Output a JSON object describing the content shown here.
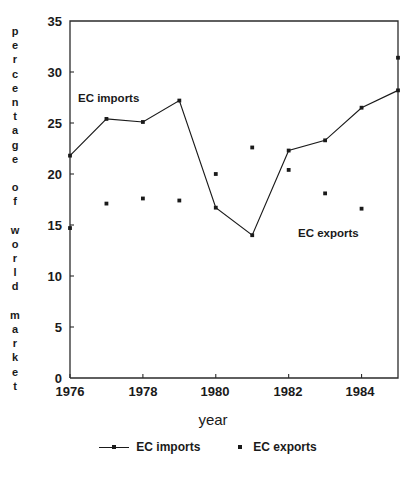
{
  "chart_data": {
    "type": "line",
    "title": "",
    "xlabel": "year",
    "ylabel": "percentage of world market",
    "ylabel_letters": [
      "p",
      "e",
      "r",
      "c",
      "e",
      "n",
      "t",
      "a",
      "g",
      "e",
      "",
      "o",
      "f",
      "",
      "w",
      "o",
      "r",
      "l",
      "d",
      "",
      "m",
      "a",
      "r",
      "k",
      "e",
      "t"
    ],
    "x": [
      1976,
      1977,
      1978,
      1979,
      1980,
      1981,
      1982,
      1983,
      1984,
      1985
    ],
    "xlim": [
      1976,
      1985
    ],
    "ylim": [
      0,
      35
    ],
    "xticks": [
      1976,
      1978,
      1980,
      1982,
      1984
    ],
    "xtick_labels": [
      "1976",
      "1978",
      "1980",
      "1982",
      "1984"
    ],
    "yticks": [
      0,
      5,
      10,
      15,
      20,
      25,
      30,
      35
    ],
    "ytick_labels": [
      "0",
      "5",
      "10",
      "15",
      "20",
      "25",
      "30",
      "35"
    ],
    "grid": false,
    "legend_position": "below",
    "series": [
      {
        "name": "EC imports",
        "style": "line-with-markers",
        "values": [
          21.8,
          25.4,
          25.1,
          27.2,
          16.7,
          14.0,
          22.3,
          23.3,
          26.5,
          28.2
        ]
      },
      {
        "name": "EC exports",
        "style": "markers-only",
        "values": [
          14.7,
          17.1,
          17.6,
          17.4,
          20.0,
          22.6,
          20.4,
          18.1,
          16.6,
          31.4
        ]
      }
    ],
    "annotations": [
      {
        "text": "EC imports",
        "x": 1978.1,
        "y": 27.6
      },
      {
        "text": "EC exports",
        "x": 1982.4,
        "y": 13.3
      }
    ],
    "colors": {
      "line": "#1a1a1a",
      "marker": "#1a1a1a",
      "axis": "#2b2b2b",
      "background": "#ffffff"
    }
  },
  "legend": {
    "entries": [
      {
        "label": "EC imports",
        "marker": "line-marker"
      },
      {
        "label": "EC exports",
        "marker": "dot"
      }
    ]
  }
}
